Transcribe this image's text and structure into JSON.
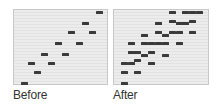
{
  "panels": [
    {
      "id": "before",
      "caption": "Before",
      "frame": {
        "x": 13,
        "y": 9,
        "w": 95,
        "h": 76
      },
      "blocks": [
        [
          95,
          10
        ],
        [
          81,
          21
        ],
        [
          67,
          30
        ],
        [
          88,
          30
        ],
        [
          54,
          41
        ],
        [
          75,
          41
        ],
        [
          40,
          52
        ],
        [
          61,
          52
        ],
        [
          27,
          61
        ],
        [
          47,
          61
        ],
        [
          33,
          70
        ],
        [
          20,
          81
        ]
      ]
    },
    {
      "id": "after",
      "caption": "After",
      "frame": {
        "x": 113,
        "y": 9,
        "w": 96,
        "h": 76
      },
      "blocks": [
        [
          168,
          10
        ],
        [
          181,
          10
        ],
        [
          188,
          10
        ],
        [
          195,
          10
        ],
        [
          168,
          19
        ],
        [
          175,
          21
        ],
        [
          181,
          21
        ],
        [
          188,
          19
        ],
        [
          154,
          21
        ],
        [
          154,
          30
        ],
        [
          161,
          33
        ],
        [
          168,
          30
        ],
        [
          175,
          30
        ],
        [
          188,
          30
        ],
        [
          140,
          33
        ],
        [
          127,
          41
        ],
        [
          140,
          41
        ],
        [
          147,
          41
        ],
        [
          154,
          41
        ],
        [
          161,
          41
        ],
        [
          175,
          41
        ],
        [
          127,
          50
        ],
        [
          133,
          50
        ],
        [
          140,
          53
        ],
        [
          147,
          50
        ],
        [
          161,
          53
        ],
        [
          133,
          58
        ],
        [
          120,
          61
        ],
        [
          127,
          61
        ],
        [
          147,
          61
        ],
        [
          120,
          70
        ],
        [
          133,
          70
        ],
        [
          120,
          81
        ]
      ]
    }
  ],
  "colors": {
    "block": "#3a3a3a",
    "panel_bg": "#e8e8e8",
    "panel_border": "#c8c8c8",
    "caption": "#333333"
  }
}
